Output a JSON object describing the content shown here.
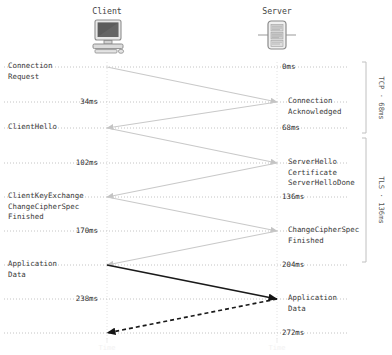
{
  "endpoints": {
    "client": {
      "label": "Client",
      "icon": "desktop-computer-icon",
      "x": 107
    },
    "server": {
      "label": "Server",
      "icon": "server-rack-icon",
      "x": 277
    }
  },
  "colors": {
    "handshake_arrow": "#c9c9c9",
    "data_arrow": "#1a1a1a",
    "timeline_dots": "#bdbdbd",
    "text": "#3a3a3a",
    "bracket": "#c0c0c0",
    "background": "#ffffff"
  },
  "rows": [
    {
      "id": "connection-request",
      "y": 67,
      "left_label": "Connection\nRequest",
      "right_label": "",
      "time_left": "",
      "time_right": "0ms"
    },
    {
      "id": "connection-acknowledged",
      "y": 102,
      "left_label": "",
      "right_label": "Connection\nAcknowledged",
      "time_left": "34ms",
      "time_right": ""
    },
    {
      "id": "client-hello",
      "y": 128,
      "left_label": "ClientHello",
      "right_label": "",
      "time_left": "",
      "time_right": "68ms"
    },
    {
      "id": "server-hello",
      "y": 163,
      "left_label": "",
      "right_label": "ServerHello\nCertificate\nServerHelloDone",
      "time_left": "102ms",
      "time_right": ""
    },
    {
      "id": "client-key-exchange",
      "y": 197,
      "left_label": "ClientKeyExchange\nChangeCipherSpec\nFinished",
      "right_label": "",
      "time_left": "",
      "time_right": "136ms"
    },
    {
      "id": "server-change-cipher-spec",
      "y": 231,
      "left_label": "",
      "right_label": "ChangeCipherSpec\nFinished",
      "time_left": "170ms",
      "time_right": ""
    },
    {
      "id": "application-data-out",
      "y": 265,
      "left_label": "Application\nData",
      "right_label": "",
      "time_left": "",
      "time_right": "204ms"
    },
    {
      "id": "application-data-in",
      "y": 299,
      "left_label": "",
      "right_label": "Application\nData",
      "time_left": "238ms",
      "time_right": ""
    },
    {
      "id": "complete",
      "y": 333,
      "left_label": "",
      "right_label": "",
      "time_left": "",
      "time_right": "272ms"
    }
  ],
  "messages": [
    {
      "id": "msg-syn",
      "from": "client",
      "to": "server",
      "y1": 67,
      "y2": 102,
      "style": "gray-solid"
    },
    {
      "id": "msg-syn-ack",
      "from": "server",
      "to": "client",
      "y1": 102,
      "y2": 128,
      "style": "gray-solid"
    },
    {
      "id": "msg-client-hello",
      "from": "client",
      "to": "server",
      "y1": 128,
      "y2": 163,
      "style": "gray-solid"
    },
    {
      "id": "msg-server-hello",
      "from": "server",
      "to": "client",
      "y1": 163,
      "y2": 197,
      "style": "gray-solid"
    },
    {
      "id": "msg-key-exchange",
      "from": "client",
      "to": "server",
      "y1": 197,
      "y2": 231,
      "style": "gray-solid"
    },
    {
      "id": "msg-ccs-finished",
      "from": "server",
      "to": "client",
      "y1": 231,
      "y2": 265,
      "style": "gray-solid"
    },
    {
      "id": "msg-app-data-out",
      "from": "client",
      "to": "server",
      "y1": 265,
      "y2": 299,
      "style": "black-solid"
    },
    {
      "id": "msg-app-data-in",
      "from": "server",
      "to": "client",
      "y1": 299,
      "y2": 333,
      "style": "black-dashed"
    }
  ],
  "brackets": [
    {
      "id": "tcp-bracket",
      "label": "TCP · 68ms",
      "y_top": 62,
      "y_bottom": 133
    },
    {
      "id": "tls-bracket",
      "label": "TLS · 136ms",
      "y_top": 138,
      "y_bottom": 262
    }
  ],
  "axis_footers": {
    "client_foot": "Time",
    "server_foot": "Time"
  }
}
